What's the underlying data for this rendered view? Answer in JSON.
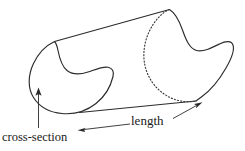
{
  "figure": {
    "type": "geometry-diagram",
    "background_color": "#ffffff",
    "stroke_color": "#2b2b2b",
    "hidden_edge_color": "#3a3a3a",
    "label_color": "#1a1a1a",
    "labels": {
      "cross_section": "cross-section",
      "length": "length"
    },
    "annotations": [
      {
        "name": "cross-section",
        "text": "cross-section",
        "leader": "single-headed vertical arrow pointing up to the near face outline",
        "arrow_heads": 1
      },
      {
        "name": "length",
        "text": "length",
        "leader": "double-headed arrow along the bottom edge of the prism",
        "arrow_heads": 2
      }
    ],
    "shapes": {
      "near_face": "kidney shaped closed curve (solid)",
      "far_face_visible": "kidney shaped curve, right portion solid",
      "far_face_hidden": "left portion of far face drawn dotted",
      "top_edge": "straight line joining the two face peaks",
      "bottom_edge": "straight line joining the two face bottoms"
    }
  }
}
